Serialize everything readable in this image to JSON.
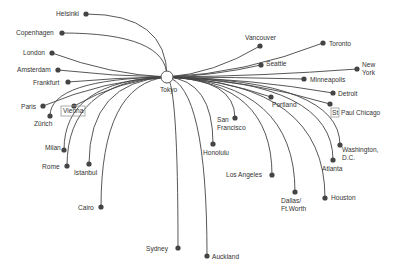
{
  "diagram": {
    "type": "hub-and-spoke route map",
    "hub": {
      "name": "Tokyo",
      "x": 167,
      "y": 77,
      "label_x": 160,
      "label_y": 92
    },
    "colors": {
      "line": "#444444",
      "node": "#444444",
      "label": "#333333",
      "hub_fill": "#ffffff",
      "highlight_box": "#999999"
    },
    "destinations": [
      {
        "name": "Helsinki",
        "x": 86,
        "y": 14,
        "lx": 56,
        "ly": 16,
        "anchor": "start"
      },
      {
        "name": "Copenhagen",
        "x": 62,
        "y": 33,
        "lx": 16,
        "ly": 35,
        "anchor": "start"
      },
      {
        "name": "London",
        "x": 52,
        "y": 53,
        "lx": 23,
        "ly": 55,
        "anchor": "start"
      },
      {
        "name": "Amsterdam",
        "x": 58,
        "y": 70,
        "lx": 17,
        "ly": 72,
        "anchor": "start"
      },
      {
        "name": "Frankfurt",
        "x": 68,
        "y": 82,
        "lx": 33,
        "ly": 85,
        "anchor": "start"
      },
      {
        "name": "Paris",
        "x": 43,
        "y": 106,
        "lx": 21,
        "ly": 109,
        "anchor": "start"
      },
      {
        "name": "Zürich",
        "x": 50,
        "y": 116,
        "lx": 34,
        "ly": 126,
        "anchor": "start"
      },
      {
        "name": "Vienna",
        "x": 74,
        "y": 106,
        "lx": 63,
        "ly": 113,
        "anchor": "start",
        "boxed": true
      },
      {
        "name": "Milan",
        "x": 64,
        "y": 150,
        "lx": 45,
        "ly": 150,
        "anchor": "start"
      },
      {
        "name": "Rome",
        "x": 67,
        "y": 166,
        "lx": 42,
        "ly": 169,
        "anchor": "start"
      },
      {
        "name": "Istanbul",
        "x": 89,
        "y": 164,
        "lx": 74,
        "ly": 175,
        "anchor": "start"
      },
      {
        "name": "Cairo",
        "x": 101,
        "y": 207,
        "lx": 78,
        "ly": 210,
        "anchor": "start"
      },
      {
        "name": "Sydney",
        "x": 178,
        "y": 248,
        "lx": 146,
        "ly": 251,
        "anchor": "start"
      },
      {
        "name": "Auckland",
        "x": 207,
        "y": 256,
        "lx": 212,
        "ly": 259,
        "anchor": "start"
      },
      {
        "name": "Honolulu",
        "x": 213,
        "y": 144,
        "lx": 203,
        "ly": 155,
        "anchor": "start"
      },
      {
        "name": "San Francisco",
        "x": 235,
        "y": 118,
        "lines": [
          "San",
          "Francisco"
        ],
        "lx": 217,
        "ly": 122,
        "anchor": "start"
      },
      {
        "name": "Los Angeles",
        "x": 272,
        "y": 175,
        "lx": 226,
        "ly": 177,
        "anchor": "start"
      },
      {
        "name": "Dallas/ Ft.Worth",
        "x": 295,
        "y": 192,
        "lines": [
          "Dallas/",
          "Ft.Worth"
        ],
        "lx": 281,
        "ly": 203,
        "anchor": "start"
      },
      {
        "name": "Houston",
        "x": 325,
        "y": 198,
        "lx": 331,
        "ly": 200,
        "anchor": "start"
      },
      {
        "name": "Atlanta",
        "x": 333,
        "y": 160,
        "lx": 322,
        "ly": 171,
        "anchor": "start"
      },
      {
        "name": "Washington, D.C.",
        "x": 340,
        "y": 145,
        "lines": [
          "Washington,",
          "D.C."
        ],
        "lx": 342,
        "ly": 152,
        "anchor": "start"
      },
      {
        "name": "Portland",
        "x": 271,
        "y": 97,
        "lx": 272,
        "ly": 107,
        "anchor": "start"
      },
      {
        "name": "Paul Chicago",
        "x": 330,
        "y": 104,
        "lx": 341,
        "ly": 115,
        "anchor": "start",
        "prefix_box": "St"
      },
      {
        "name": "Detroit",
        "x": 333,
        "y": 93,
        "lx": 338,
        "ly": 96,
        "anchor": "start"
      },
      {
        "name": "Minneapolis",
        "x": 304,
        "y": 79,
        "lx": 310,
        "ly": 82,
        "anchor": "start"
      },
      {
        "name": "New York",
        "x": 357,
        "y": 69,
        "lines": [
          "New",
          "York"
        ],
        "lx": 362,
        "ly": 67,
        "anchor": "start"
      },
      {
        "name": "Seattle",
        "x": 261,
        "y": 65,
        "lx": 266,
        "ly": 66,
        "anchor": "start"
      },
      {
        "name": "Toronto",
        "x": 323,
        "y": 43,
        "lx": 329,
        "ly": 46,
        "anchor": "start"
      },
      {
        "name": "Vancouver",
        "x": 260,
        "y": 46,
        "lx": 245,
        "ly": 40,
        "anchor": "start"
      }
    ]
  }
}
